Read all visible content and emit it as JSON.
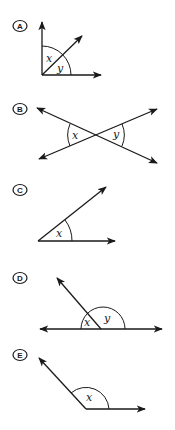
{
  "options": [
    {
      "letter": "A",
      "angles": [
        "x",
        "y"
      ],
      "description": "Right angle divided by a ray into adjacent angles x and y"
    },
    {
      "letter": "B",
      "angles": [
        "x",
        "y"
      ],
      "description": "Two intersecting lines with vertical angles x and y"
    },
    {
      "letter": "C",
      "angles": [
        "x"
      ],
      "description": "Single acute angle x"
    },
    {
      "letter": "D",
      "angles": [
        "x",
        "y"
      ],
      "description": "Straight line divided by a ray into adjacent angles x and y"
    },
    {
      "letter": "E",
      "angles": [
        "x"
      ],
      "description": "Single obtuse angle x"
    }
  ],
  "colors": {
    "stroke": "#1a1a1a",
    "background": "#ffffff"
  }
}
